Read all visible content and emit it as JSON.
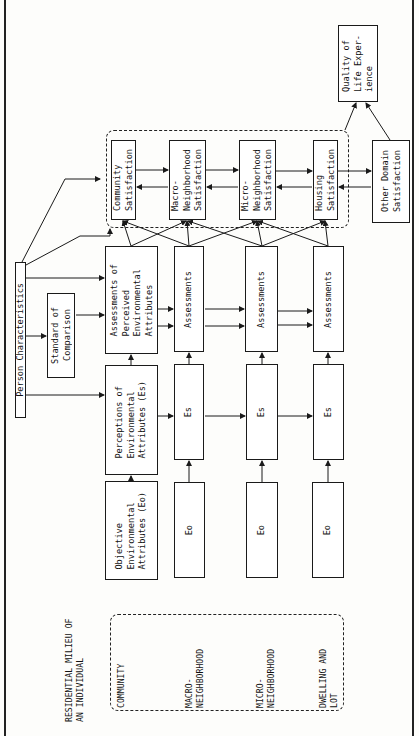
{
  "diagram": {
    "title": "RESIDENTIAL MILIEU OF\nAN INDIVIDUAL",
    "levels": [
      "COMMUNITY",
      "MACRO-\nNEIGHBORHOOD",
      "MICRO-\nNEIGHBORHOOD",
      "DWELLING AND\nLOT"
    ],
    "person_characteristics": "Person Characteristics",
    "standard_of_comparison": "Standard of\nComparison",
    "objective": "Objective\nEnvironmental\nAttributes (Eo)",
    "perceptions": "Perceptions of\nEnvironmental\nAttributes (Es)",
    "assessments_perceived": "Assessments of\nPerceived\nEnvironmental\nAttributes",
    "eo_label": "Eo",
    "es_label": "Es",
    "assessments_label": "Assessments",
    "satisfaction": [
      "Community\nSatisfaction",
      "Macro-\nNeighborhood\nSatisfaction",
      "Micro-\nNeighborhood\nSatisfaction",
      "Housing\nSatisfaction"
    ],
    "other_domain": "Other Domain\nSatisfaction",
    "quality_of_life": "Quality of\nLife Exper-\nience"
  }
}
